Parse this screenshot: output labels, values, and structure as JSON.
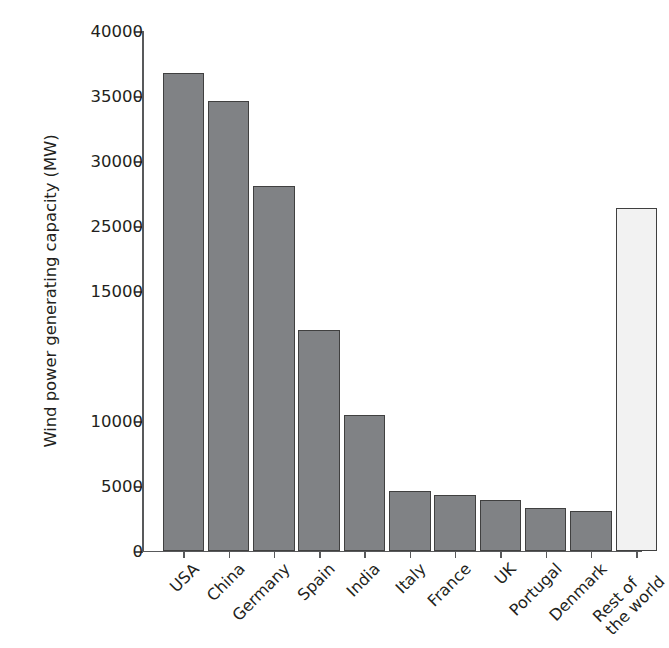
{
  "chart_data": {
    "type": "bar",
    "title": "",
    "xlabel": "",
    "ylabel": "Wind power generating capacity (MW)",
    "ylim": [
      0,
      40000
    ],
    "grid": false,
    "legend": null,
    "y_ticks": [
      {
        "label": "0",
        "value": 0
      },
      {
        "label": "5000",
        "value": 5000
      },
      {
        "label": "10000",
        "value": 10000
      },
      {
        "label": "15000",
        "value": 20000
      },
      {
        "label": "25000",
        "value": 25000
      },
      {
        "label": "30000",
        "value": 30000
      },
      {
        "label": "35000",
        "value": 35000
      },
      {
        "label": "40000",
        "value": 40000
      }
    ],
    "categories": [
      "USA",
      "China",
      "Germany",
      "Spain",
      "India",
      "Italy",
      "France",
      "UK",
      "Portugal",
      "Denmark",
      "Rest of\nthe world"
    ],
    "values": [
      36800,
      34600,
      28100,
      17000,
      10500,
      4600,
      4300,
      3900,
      3300,
      3100,
      26400
    ],
    "bar_styles": [
      "filled",
      "filled",
      "filled",
      "filled",
      "filled",
      "filled",
      "filled",
      "filled",
      "filled",
      "filled",
      "hollow"
    ],
    "colors": {
      "bar_fill": "#808285",
      "bar_fill_highlight": "#f2f2f2",
      "bar_stroke": "#404040",
      "axis": "#58595b",
      "text": "#231f20",
      "background": "#ffffff"
    }
  },
  "x_labels": [
    {
      "line1": "USA",
      "line2": ""
    },
    {
      "line1": "China",
      "line2": ""
    },
    {
      "line1": "Germany",
      "line2": ""
    },
    {
      "line1": "Spain",
      "line2": ""
    },
    {
      "line1": "India",
      "line2": ""
    },
    {
      "line1": "Italy",
      "line2": ""
    },
    {
      "line1": "France",
      "line2": ""
    },
    {
      "line1": "UK",
      "line2": ""
    },
    {
      "line1": "Portugal",
      "line2": ""
    },
    {
      "line1": "Denmark",
      "line2": ""
    },
    {
      "line1": "Rest of",
      "line2": "the world"
    }
  ]
}
